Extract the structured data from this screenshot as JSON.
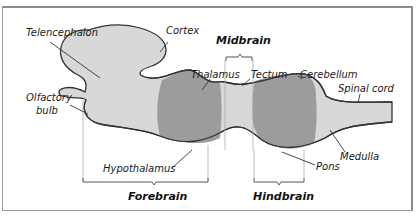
{
  "figure": {
    "colors": {
      "light_region": "#d6d6d6",
      "dark_region": "#9a9a9a",
      "outline": "#333333",
      "text": "#1a1a1a"
    },
    "divisions": [
      {
        "id": "forebrain",
        "label": "Forebrain"
      },
      {
        "id": "midbrain",
        "label": "Midbrain"
      },
      {
        "id": "hindbrain",
        "label": "Hindbrain"
      }
    ],
    "labels": {
      "telencephalon": "Telencephalon",
      "cortex": "Cortex",
      "olfactory_1": "Olfactory",
      "olfactory_2": "bulb",
      "thalamus": "Thalamus",
      "tectum": "Tectum",
      "cerebellum": "Cerebellum",
      "spinal_cord": "Spinal cord",
      "hypothalamus": "Hypothalamus",
      "medulla": "Medulla",
      "pons": "Pons"
    }
  }
}
